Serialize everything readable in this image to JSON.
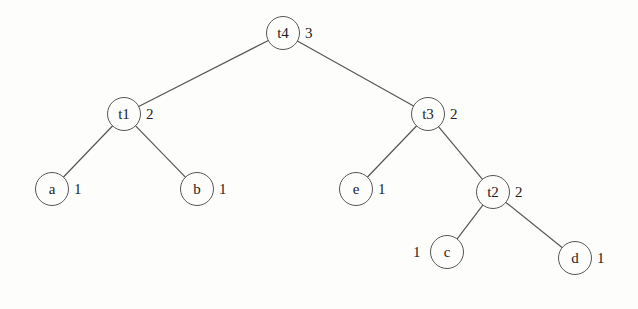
{
  "diagram": {
    "background_color": "#fdfdfb",
    "stroke_color": "#565656",
    "text_color": "#1d1d1d",
    "nodes": [
      {
        "id": "t4",
        "label": "t4",
        "weight": "3",
        "weight_side": "right",
        "cx": 283,
        "cy": 33,
        "rx": 17,
        "ry": 17
      },
      {
        "id": "t1",
        "label": "t1",
        "weight": "2",
        "weight_side": "right",
        "cx": 124,
        "cy": 114,
        "rx": 17,
        "ry": 17
      },
      {
        "id": "t3",
        "label": "t3",
        "weight": "2",
        "weight_side": "right",
        "cx": 428,
        "cy": 114,
        "rx": 17,
        "ry": 17
      },
      {
        "id": "a",
        "label": "a",
        "weight": "1",
        "weight_side": "right",
        "cx": 52,
        "cy": 189,
        "rx": 17,
        "ry": 17
      },
      {
        "id": "b",
        "label": "b",
        "weight": "1",
        "weight_side": "right",
        "cx": 197,
        "cy": 189,
        "rx": 17,
        "ry": 17
      },
      {
        "id": "e",
        "label": "e",
        "weight": "1",
        "weight_side": "right",
        "cx": 356,
        "cy": 189,
        "rx": 17,
        "ry": 17
      },
      {
        "id": "t2",
        "label": "t2",
        "weight": "2",
        "weight_side": "right",
        "cx": 493,
        "cy": 192,
        "rx": 17,
        "ry": 17
      },
      {
        "id": "c",
        "label": "c",
        "weight": "1",
        "weight_side": "left",
        "cx": 447,
        "cy": 252,
        "rx": 17,
        "ry": 17
      },
      {
        "id": "d",
        "label": "d",
        "weight": "1",
        "weight_side": "right",
        "cx": 575,
        "cy": 258,
        "rx": 17,
        "ry": 17
      }
    ],
    "edges": [
      {
        "from": "t4",
        "to": "t1"
      },
      {
        "from": "t4",
        "to": "t3"
      },
      {
        "from": "t1",
        "to": "a"
      },
      {
        "from": "t1",
        "to": "b"
      },
      {
        "from": "t3",
        "to": "e"
      },
      {
        "from": "t3",
        "to": "t2"
      },
      {
        "from": "t2",
        "to": "c"
      },
      {
        "from": "t2",
        "to": "d"
      }
    ]
  }
}
